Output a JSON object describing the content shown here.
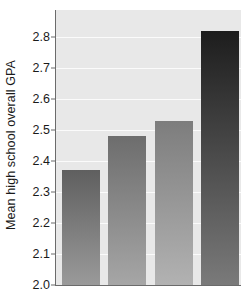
{
  "chart_data": {
    "type": "bar",
    "title": "",
    "xlabel": "",
    "ylabel": "Mean high school overall GPA",
    "categories": [
      "",
      "",
      "",
      ""
    ],
    "values": [
      2.37,
      2.48,
      2.53,
      2.82
    ],
    "ylim": [
      2.0,
      2.85
    ],
    "yticks": [
      2.0,
      2.1,
      2.2,
      2.3,
      2.4,
      2.5,
      2.6,
      2.7,
      2.8
    ],
    "ytick_labels": [
      "2.0",
      "2.1",
      "2.2",
      "2.3",
      "2.4",
      "2.5",
      "2.6",
      "2.7",
      "2.8"
    ],
    "xticks": [],
    "xtick_labels": [],
    "grid": "horizontal",
    "legend": "none",
    "plot_background": "#e8e8e8",
    "gridline_color": "#fbfbfb",
    "bar_colors": [
      "#5f5f5f",
      "#6d6d6d",
      "#7d7d7d",
      "#1d1d1d"
    ]
  }
}
